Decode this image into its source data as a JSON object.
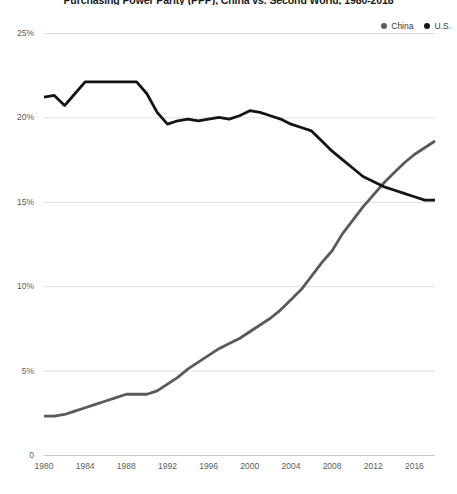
{
  "chart_data": {
    "type": "line",
    "title": "Purchasing Power Parity (PPP), China vs. Second World, 1980-2018",
    "xlabel": "",
    "ylabel": "",
    "xlim": [
      1980,
      2018
    ],
    "ylim": [
      0,
      25
    ],
    "grid": true,
    "legend_position": "top-right",
    "y_ticks": [
      "0",
      "5%",
      "10%",
      "15%",
      "20%",
      "25%"
    ],
    "y_tick_values": [
      0,
      5,
      10,
      15,
      20,
      25
    ],
    "x_ticks": [
      "1980",
      "1984",
      "1988",
      "1992",
      "1996",
      "2000",
      "2004",
      "2008",
      "2012",
      "2016"
    ],
    "x_tick_values": [
      1980,
      1984,
      1988,
      1992,
      1996,
      2000,
      2004,
      2008,
      2012,
      2016
    ],
    "x": [
      1980,
      1981,
      1982,
      1983,
      1984,
      1985,
      1986,
      1987,
      1988,
      1989,
      1990,
      1991,
      1992,
      1993,
      1994,
      1995,
      1996,
      1997,
      1998,
      1999,
      2000,
      2001,
      2002,
      2003,
      2004,
      2005,
      2006,
      2007,
      2008,
      2009,
      2010,
      2011,
      2012,
      2013,
      2014,
      2015,
      2016,
      2017,
      2018
    ],
    "series": [
      {
        "name": "China",
        "color": "#5a5a5a",
        "values": [
          2.3,
          2.3,
          2.4,
          2.6,
          2.8,
          3.0,
          3.2,
          3.4,
          3.6,
          3.6,
          3.6,
          3.8,
          4.2,
          4.6,
          5.1,
          5.5,
          5.9,
          6.3,
          6.6,
          6.9,
          7.3,
          7.7,
          8.1,
          8.6,
          9.2,
          9.8,
          10.6,
          11.4,
          12.1,
          13.1,
          13.9,
          14.7,
          15.4,
          16.1,
          16.7,
          17.3,
          17.8,
          18.2,
          18.6
        ]
      },
      {
        "name": "U.S.",
        "color": "#141414",
        "values": [
          21.2,
          21.3,
          20.7,
          21.4,
          22.1,
          22.1,
          22.1,
          22.1,
          22.1,
          22.1,
          21.4,
          20.3,
          19.6,
          19.8,
          19.9,
          19.8,
          19.9,
          20.0,
          19.9,
          20.1,
          20.4,
          20.3,
          20.1,
          19.9,
          19.6,
          19.4,
          19.2,
          18.6,
          18.0,
          17.5,
          17.0,
          16.5,
          16.2,
          15.9,
          15.7,
          15.5,
          15.3,
          15.1,
          15.1
        ]
      }
    ]
  },
  "legend": {
    "china_label": "China",
    "us_label": "U.S."
  }
}
